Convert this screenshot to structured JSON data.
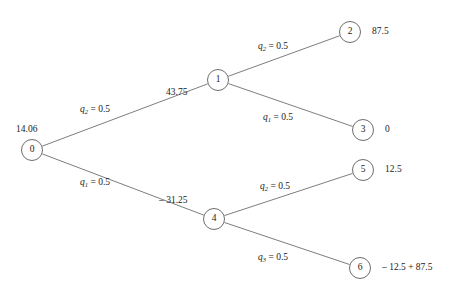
{
  "diagram": {
    "type": "binary-decision-tree",
    "title": "",
    "stroke_color": "#6e6e6e",
    "text_color": "#1a1a1a",
    "background": "#ffffff",
    "nodes": [
      {
        "id": "0",
        "label": "0",
        "value": "14.06",
        "x": 32,
        "y": 150,
        "value_x": 16,
        "value_y": 125
      },
      {
        "id": "1",
        "label": "1",
        "value": "43.75",
        "x": 218,
        "y": 80,
        "value_x": 166,
        "value_y": 88
      },
      {
        "id": "2",
        "label": "2",
        "value": "87.5",
        "x": 350,
        "y": 32,
        "value_x": 372,
        "value_y": 27
      },
      {
        "id": "3",
        "label": "3",
        "value": "0",
        "x": 363,
        "y": 130,
        "value_x": 385,
        "value_y": 125
      },
      {
        "id": "4",
        "label": "4",
        "value": "– 31.25",
        "x": 214,
        "y": 219,
        "value_x": 159,
        "value_y": 196
      },
      {
        "id": "5",
        "label": "5",
        "value": "12.5",
        "x": 363,
        "y": 170,
        "value_x": 385,
        "value_y": 165
      },
      {
        "id": "6",
        "label": "6",
        "value": "– 12.5 + 87.5",
        "x": 360,
        "y": 268,
        "value_x": 382,
        "value_y": 263
      }
    ],
    "edges": [
      {
        "from": "0",
        "to": "1",
        "q": "q",
        "subscript": "2",
        "probability": "0.5",
        "label_x": 80,
        "label_y": 105
      },
      {
        "from": "0",
        "to": "4",
        "q": "q",
        "subscript": "1",
        "probability": "0.5",
        "label_x": 80,
        "label_y": 178
      },
      {
        "from": "1",
        "to": "2",
        "q": "q",
        "subscript": "2",
        "probability": "0.5",
        "label_x": 258,
        "label_y": 42
      },
      {
        "from": "1",
        "to": "3",
        "q": "q",
        "subscript": "1",
        "probability": "0.5",
        "label_x": 263,
        "label_y": 113
      },
      {
        "from": "4",
        "to": "5",
        "q": "q",
        "subscript": "2",
        "probability": "0.5",
        "label_x": 260,
        "label_y": 182
      },
      {
        "from": "4",
        "to": "6",
        "q": "q",
        "subscript": "3",
        "probability": "0.5",
        "label_x": 258,
        "label_y": 253
      }
    ],
    "equals_sign": " = "
  }
}
